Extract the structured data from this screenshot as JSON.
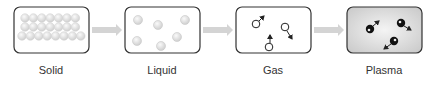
{
  "states": [
    {
      "label": "Solid",
      "particles": "tightly packed"
    },
    {
      "label": "Liquid",
      "particles": "loosely spaced"
    },
    {
      "label": "Gas",
      "particles": "free moving with direction arrows"
    },
    {
      "label": "Plasma",
      "particles": "ionized, free moving with direction arrows"
    }
  ],
  "arrow_icon": "right-arrow",
  "colors": {
    "border": "#333333",
    "solid_particle": "#e0e0e0",
    "liquid_particle": "#dcdcdc",
    "plasma_fill": "#d6d6d6",
    "arrow": "#d0d0d0"
  }
}
